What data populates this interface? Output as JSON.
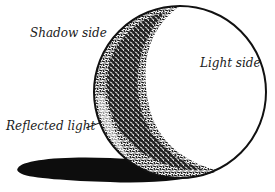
{
  "diagram": {
    "type": "shaded-sphere-illustration",
    "labels": {
      "shadow_side": "Shadow side",
      "light_side": "Light side",
      "reflected_light": "Reflected light"
    },
    "colors": {
      "ink": "#1a1a1a",
      "background": "#ffffff"
    }
  }
}
